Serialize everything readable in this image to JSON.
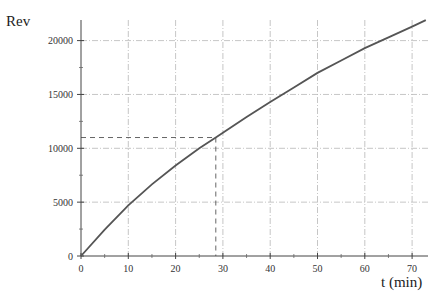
{
  "chart_data": {
    "type": "line",
    "title": "",
    "xlabel": "t (min)",
    "ylabel": "Rev",
    "xlim": [
      0,
      73
    ],
    "ylim": [
      0,
      22000
    ],
    "grid": true,
    "grid_style": "dash-dot, light gray",
    "legend": null,
    "x_ticks": [
      0,
      10,
      20,
      30,
      40,
      50,
      60,
      70
    ],
    "y_ticks": [
      0,
      5000,
      10000,
      15000,
      20000
    ],
    "x_minor_step": 5,
    "y_minor_step": 2500,
    "series": [
      {
        "name": "Rev",
        "color": "#555555",
        "x": [
          0,
          5,
          10,
          15,
          20,
          25,
          28.5,
          30,
          35,
          40,
          45,
          50,
          55,
          60,
          65,
          70,
          72.9
        ],
        "y": [
          0,
          2450,
          4700,
          6650,
          8400,
          10000,
          11000,
          11450,
          12900,
          14300,
          15650,
          17000,
          18150,
          19300,
          20300,
          21300,
          21900
        ]
      }
    ],
    "annotations": [
      {
        "type": "dashed-guide",
        "x": 28.5,
        "y": 11000,
        "description": "dashed lines from axes to the point (28.5, 11000) on the curve"
      }
    ]
  }
}
